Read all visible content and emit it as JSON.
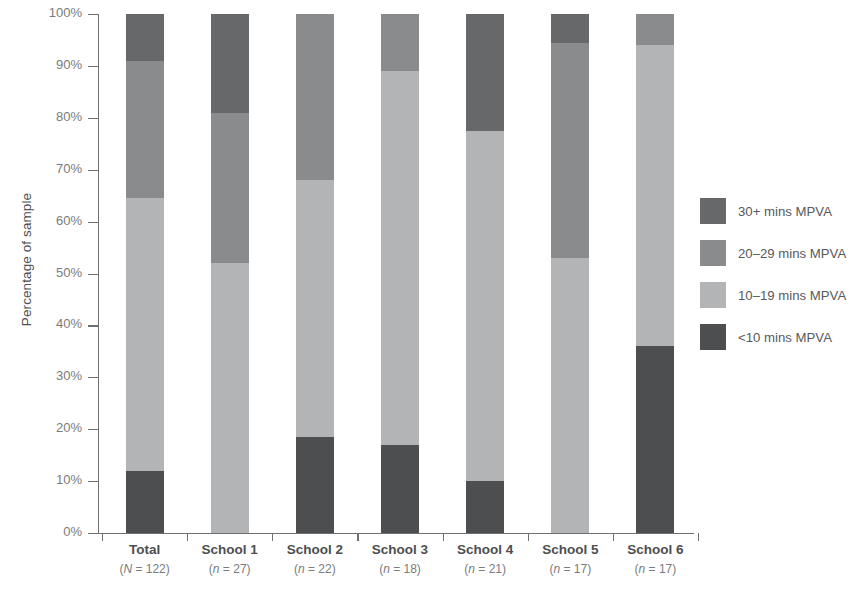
{
  "chart_data": {
    "type": "bar",
    "subtype": "stacked-bar-100-percent",
    "title": "",
    "xlabel": "",
    "ylabel": "Percentage of sample",
    "ylim": [
      0,
      100
    ],
    "y_tick_labels": [
      "0%",
      "10%",
      "20%",
      "30%",
      "40%",
      "50%",
      "60%",
      "70%",
      "80%",
      "90%",
      "100%"
    ],
    "y_tick_values": [
      0,
      10,
      20,
      30,
      40,
      50,
      60,
      70,
      80,
      90,
      100
    ],
    "grid": false,
    "legend_position": "right",
    "stack_order_bottom_to_top": [
      "<10 mins MPVA",
      "10-19 mins MPVA",
      "20-29 mins MPVA",
      "30+ mins MPVA"
    ],
    "categories": [
      "Total",
      "School 1",
      "School 2",
      "School 3",
      "School 4",
      "School 5",
      "School 6"
    ],
    "category_sublabels": [
      "(N = 122)",
      "(n = 27)",
      "(n = 22)",
      "(n = 18)",
      "(n = 21)",
      "(n = 17)",
      "(n = 17)"
    ],
    "series": [
      {
        "name": "<10 mins MPVA",
        "color": "#4d4e50",
        "values": [
          12,
          0,
          18.5,
          17,
          10,
          0,
          36
        ]
      },
      {
        "name": "10-19 mins MPVA",
        "color": "#b3b4b5",
        "values": [
          52.5,
          52,
          49.5,
          72,
          67.5,
          53,
          58
        ]
      },
      {
        "name": "20-29 mins MPVA",
        "color": "#8a8b8d",
        "values": [
          26.5,
          29,
          32,
          11,
          0,
          41.5,
          6
        ]
      },
      {
        "name": "30+ mins MPVA",
        "color": "#676869",
        "values": [
          9,
          19,
          0,
          0,
          22.5,
          5.5,
          0
        ]
      }
    ]
  },
  "legend": {
    "entries": [
      {
        "label": "30+ mins MPVA",
        "color": "#676869"
      },
      {
        "label": "20–29 mins MPVA",
        "color": "#8a8b8d"
      },
      {
        "label": "10–19 mins MPVA",
        "color": "#b3b4b5"
      },
      {
        "label": "<10 mins MPVA",
        "color": "#4d4e50"
      }
    ]
  },
  "colors": {
    "axis": "#6f7072",
    "tick_label": "#7a7b7d",
    "category_label": "#4d4e50",
    "background": "#ffffff"
  }
}
